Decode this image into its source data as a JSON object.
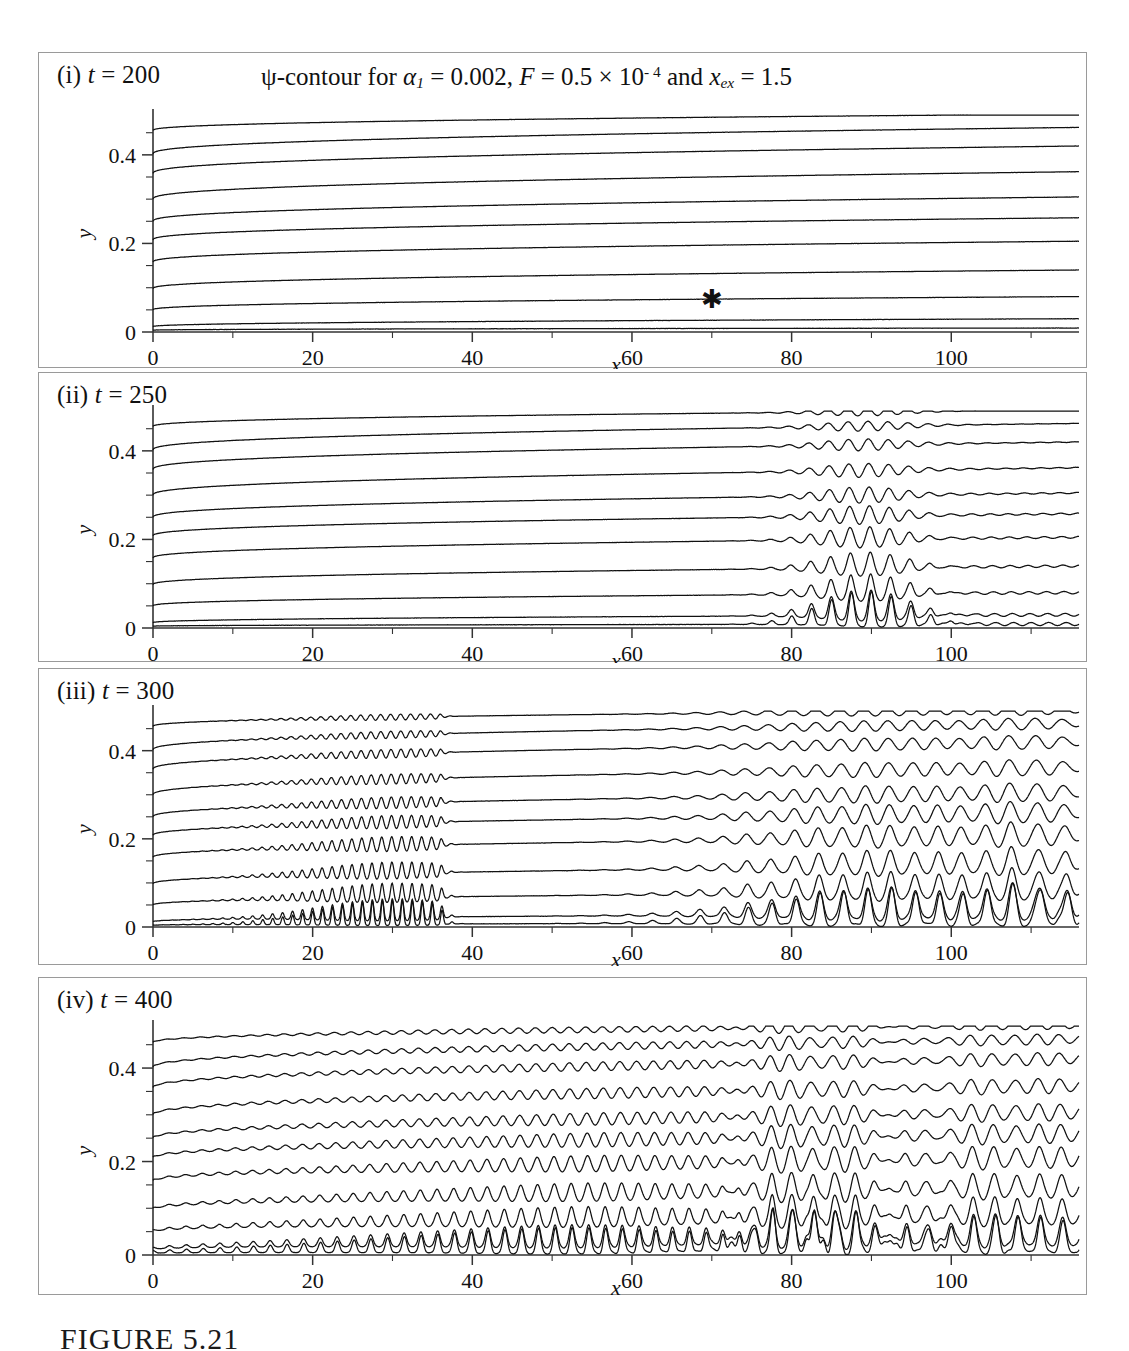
{
  "figure": {
    "title": {
      "prefix": "ψ-contour for ",
      "alpha_sym": "α",
      "alpha_sub": "1",
      "alpha_eq": " = 0.002,  ",
      "F_sym": "F",
      "F_eq": " = 0.5 × 10",
      "F_exp": "- 4",
      "and": " and  ",
      "x_sym": "x",
      "x_sub": "ex",
      "x_eq": " = 1.5",
      "full_text": "ψ-contour for α₁ = 0.002, F = 0.5 × 10⁻⁴ and xₑₓ = 1.5"
    },
    "caption": "FIGURE 5.21",
    "marker": {
      "glyph": "✱",
      "name": "asterisk-marker",
      "x_value": 70,
      "y_value": 0.075
    }
  },
  "axes": {
    "x_label": "x",
    "y_label": "y",
    "x_ticks": [
      "0",
      "20",
      "40",
      "60",
      "80",
      "100"
    ],
    "x_tick_values": [
      0,
      20,
      40,
      60,
      80,
      100
    ],
    "x_minor_step": 10,
    "x_range": [
      0,
      116
    ],
    "y_ticks": [
      "0",
      "0.2",
      "0.4"
    ],
    "y_tick_values": [
      0,
      0.2,
      0.4
    ],
    "y_minor_values": [
      0.05,
      0.1,
      0.15,
      0.25,
      0.3,
      0.35,
      0.45
    ],
    "y_range": [
      0,
      0.49
    ]
  },
  "panels": [
    {
      "id": "i",
      "label_prefix": "(i) ",
      "label_var": "t",
      "label_value": " = 200",
      "label_full": "(i) t = 200",
      "t": 200,
      "has_title": true,
      "has_marker": true,
      "wave_packets": []
    },
    {
      "id": "ii",
      "label_prefix": "(ii) ",
      "label_var": "t",
      "label_value": " = 250",
      "label_full": "(ii) t = 250",
      "t": 250,
      "has_title": false,
      "has_marker": false,
      "wave_packets": [
        {
          "center": 89,
          "width": 5.5,
          "wavelength": 2.5,
          "amplitude": 0.03,
          "name": "primary-packet"
        }
      ]
    },
    {
      "id": "iii",
      "label_prefix": "(iii) ",
      "label_var": "t",
      "label_value": " = 300",
      "label_full": "(iii) t = 300",
      "t": 300,
      "has_title": false,
      "has_marker": false,
      "wave_packets": [
        {
          "center": 30,
          "width": 9.0,
          "wavelength": 1.25,
          "amplitude": 0.022,
          "name": "upstream-front-packet",
          "front": 36
        },
        {
          "center": 91,
          "width": 13.0,
          "wavelength": 3.0,
          "amplitude": 0.032,
          "name": "primary-packet"
        },
        {
          "center": 112,
          "width": 6.0,
          "wavelength": 3.4,
          "amplitude": 0.03,
          "name": "downstream-packet"
        }
      ]
    },
    {
      "id": "iv",
      "label_prefix": "(iv) ",
      "label_var": "t",
      "label_value": " = 400",
      "label_full": "(iv) t = 400",
      "t": 400,
      "has_title": false,
      "has_marker": false,
      "wave_packets": [
        {
          "center": 55,
          "width": 26.0,
          "wavelength": 2.1,
          "amplitude": 0.02,
          "name": "broad-turbulent-region"
        },
        {
          "center": 83,
          "width": 6.0,
          "wavelength": 2.6,
          "amplitude": 0.036,
          "name": "spike-packet"
        },
        {
          "center": 108,
          "width": 11.0,
          "wavelength": 2.8,
          "amplitude": 0.03,
          "name": "trailing-packet"
        }
      ]
    }
  ],
  "contours": {
    "count": 11,
    "y0_values": [
      0.004,
      0.012,
      0.05,
      0.098,
      0.158,
      0.208,
      0.25,
      0.3,
      0.358,
      0.402,
      0.455
    ],
    "y_end_values": [
      0.009,
      0.03,
      0.08,
      0.14,
      0.205,
      0.258,
      0.305,
      0.362,
      0.42,
      0.462,
      0.492
    ],
    "description": "streamfunction contour levels rising with x (boundary-layer growth)"
  },
  "chart_data": {
    "type": "line",
    "xlabel": "x",
    "ylabel": "y",
    "xlim": [
      0,
      116
    ],
    "ylim": [
      0,
      0.49
    ],
    "grid": false,
    "legend": null,
    "subplots": [
      "(i) t = 200",
      "(ii) t = 250",
      "(iii) t = 300",
      "(iv) t = 400"
    ],
    "series_per_subplot": 11,
    "annotations": [
      {
        "text": "✱",
        "subplot": "(i) t = 200",
        "x": 70,
        "y": 0.075
      }
    ]
  }
}
